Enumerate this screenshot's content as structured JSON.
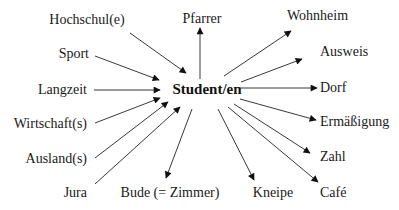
{
  "diagram": {
    "center": {
      "label": "Student/en",
      "x": 207,
      "y": 94
    },
    "nodes": [
      {
        "id": "hochschule",
        "label": "Hochschul(e)",
        "x": 87,
        "y": 24,
        "anchor": "middle",
        "arrow": {
          "x1": 130,
          "y1": 33,
          "x2": 186,
          "y2": 73
        },
        "direction": "in"
      },
      {
        "id": "pfarrer",
        "label": "Pfarrer",
        "x": 202,
        "y": 23,
        "anchor": "middle",
        "arrow": {
          "x1": 200,
          "y1": 79,
          "x2": 200,
          "y2": 28
        },
        "direction": "out"
      },
      {
        "id": "wohnheim",
        "label": "Wohnheim",
        "x": 287,
        "y": 20,
        "anchor": "start",
        "arrow": {
          "x1": 224,
          "y1": 76,
          "x2": 291,
          "y2": 31
        },
        "direction": "out"
      },
      {
        "id": "sport",
        "label": "Sport",
        "x": 89,
        "y": 58,
        "anchor": "end",
        "arrow": {
          "x1": 95,
          "y1": 56,
          "x2": 159,
          "y2": 80
        },
        "direction": "in"
      },
      {
        "id": "ausweis",
        "label": "Ausweis",
        "x": 320,
        "y": 56,
        "anchor": "start",
        "arrow": {
          "x1": 241,
          "y1": 82,
          "x2": 302,
          "y2": 59
        },
        "direction": "out"
      },
      {
        "id": "langzeit",
        "label": "Langzeit",
        "x": 87,
        "y": 94,
        "anchor": "end",
        "arrow": {
          "x1": 94,
          "y1": 90,
          "x2": 160,
          "y2": 90
        },
        "direction": "in"
      },
      {
        "id": "dorf",
        "label": "Dorf",
        "x": 320,
        "y": 92,
        "anchor": "start",
        "arrow": {
          "x1": 240,
          "y1": 88,
          "x2": 317,
          "y2": 88
        },
        "direction": "out"
      },
      {
        "id": "wirtschaft",
        "label": "Wirtschaft(s)",
        "x": 87,
        "y": 128,
        "anchor": "end",
        "arrow": {
          "x1": 95,
          "y1": 123,
          "x2": 160,
          "y2": 98
        },
        "direction": "in"
      },
      {
        "id": "ermaessigung",
        "label": "Ermäßigung",
        "x": 320,
        "y": 126,
        "anchor": "start",
        "arrow": {
          "x1": 240,
          "y1": 99,
          "x2": 316,
          "y2": 120
        },
        "direction": "out"
      },
      {
        "id": "ausland",
        "label": "Ausland(s)",
        "x": 87,
        "y": 163,
        "anchor": "end",
        "arrow": {
          "x1": 95,
          "y1": 158,
          "x2": 168,
          "y2": 102
        },
        "direction": "in"
      },
      {
        "id": "zahl",
        "label": "Zahl",
        "x": 320,
        "y": 161,
        "anchor": "start",
        "arrow": {
          "x1": 234,
          "y1": 104,
          "x2": 310,
          "y2": 153
        },
        "direction": "out"
      },
      {
        "id": "jura",
        "label": "Jura",
        "x": 87,
        "y": 197,
        "anchor": "end",
        "arrow": {
          "x1": 95,
          "y1": 184,
          "x2": 180,
          "y2": 107
        },
        "direction": "in"
      },
      {
        "id": "bude",
        "label": "Bude (= Zimmer)",
        "x": 170,
        "y": 197,
        "anchor": "middle",
        "arrow": {
          "x1": 192,
          "y1": 109,
          "x2": 166,
          "y2": 178
        },
        "direction": "out"
      },
      {
        "id": "kneipe",
        "label": "Kneipe",
        "x": 273,
        "y": 197,
        "anchor": "middle",
        "arrow": {
          "x1": 218,
          "y1": 109,
          "x2": 254,
          "y2": 180
        },
        "direction": "out"
      },
      {
        "id": "cafe",
        "label": "Café",
        "x": 320,
        "y": 197,
        "anchor": "start",
        "arrow": {
          "x1": 228,
          "y1": 107,
          "x2": 318,
          "y2": 182
        },
        "direction": "out"
      }
    ]
  }
}
